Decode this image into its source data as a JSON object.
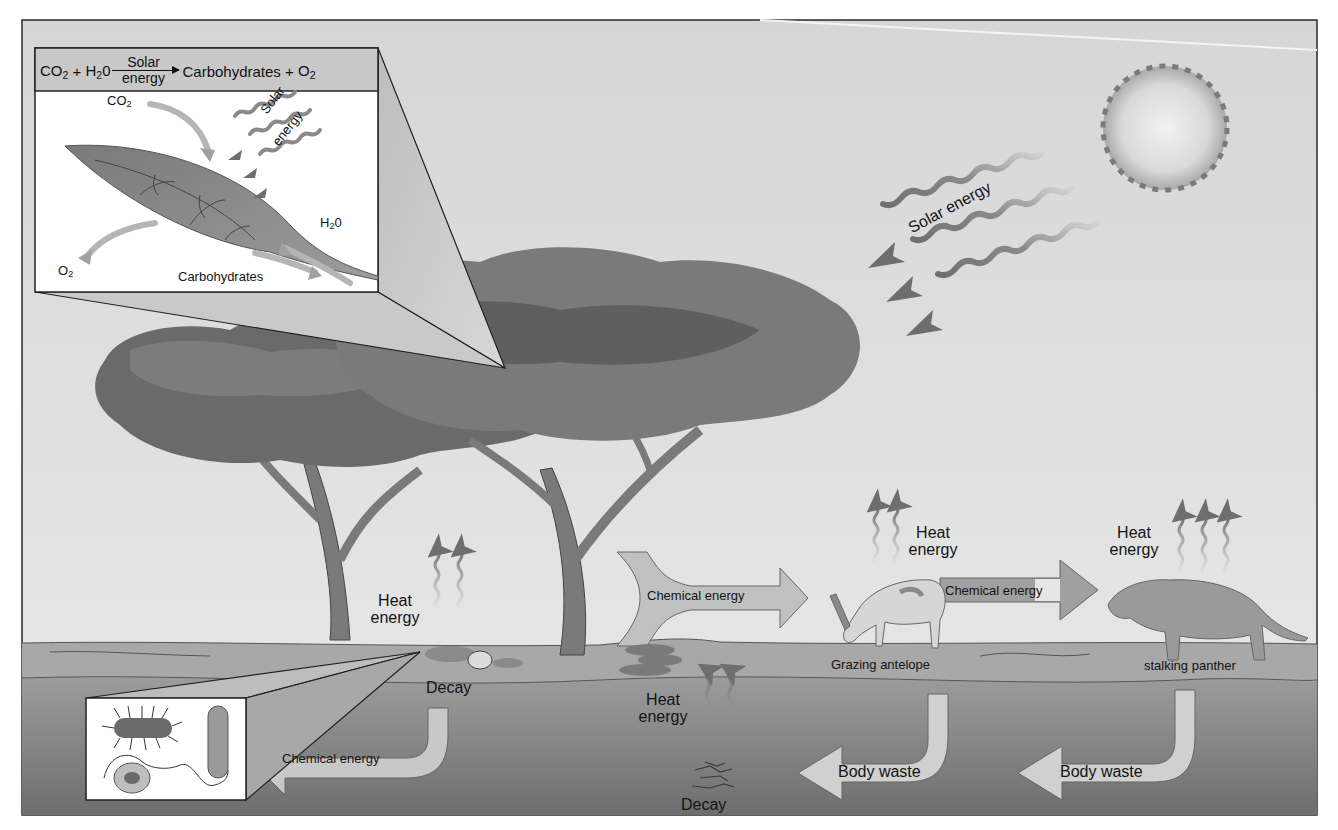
{
  "figure": {
    "colors": {
      "sky": "#dcdcdc",
      "sky_light": "#e8e8e8",
      "ground_surface": "#a9a9a9",
      "ground_deep": "#7f7f7f",
      "foliage_dark": "#6a6a6a",
      "foliage_mid": "#808080",
      "trunk": "#7a7a7a",
      "arrow_fill_light": "#cfcfcf",
      "arrow_fill_mid": "#9a9a9a",
      "frame": "#2a2a2a",
      "text": "#141414"
    }
  },
  "photosynthesis_inset": {
    "equation": {
      "reactant_1": "CO",
      "reactant_1_sub": "2",
      "plus_1": " + ",
      "reactant_2": "H",
      "reactant_2_sub": "2",
      "reactant_2_tail": "0",
      "arrow_top": "Solar",
      "arrow_bottom": "energy",
      "product_1": "Carbohydrates",
      "plus_2": " + ",
      "product_2": "O",
      "product_2_sub": "2"
    },
    "labels": {
      "co2": "CO",
      "co2_sub": "2",
      "solar_line1": "Solar",
      "solar_line2": "energy",
      "h2o": "H",
      "h2o_sub": "2",
      "h2o_tail": "0",
      "o2": "O",
      "o2_sub": "2",
      "carbohydrates": "Carbohydrates"
    }
  },
  "sun": {
    "solar_energy_label": "Solar energy"
  },
  "flows": {
    "heat_decay_tree": {
      "line1": "Heat",
      "line2": "energy"
    },
    "heat_antelope": {
      "line1": "Heat",
      "line2": "energy"
    },
    "heat_panther": {
      "line1": "Heat",
      "line2": "energy"
    },
    "heat_underground": {
      "line1": "Heat",
      "line2": "energy"
    },
    "chem_tree_to_antelope": "Chemical energy",
    "chem_antelope_to_panther": "Chemical energy",
    "chem_decay_to_microbes": "Chemical energy",
    "body_waste_antelope": "Body waste",
    "body_waste_panther": "Body waste",
    "decay_surface": "Decay",
    "decay_underground": "Decay"
  },
  "organisms": {
    "antelope": "Grazing antelope",
    "panther": "stalking panther"
  },
  "microbe_inset": {
    "items": [
      "rod-bacterium-with-flagella",
      "curved-bacillus",
      "round-cell"
    ]
  }
}
